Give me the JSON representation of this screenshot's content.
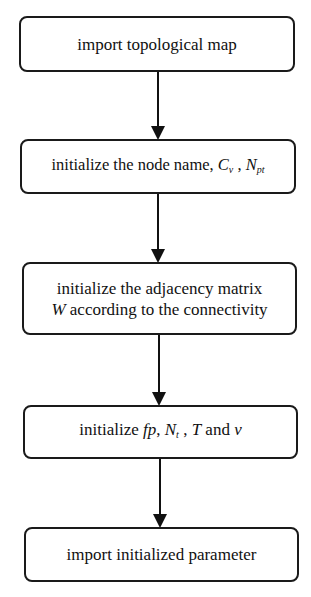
{
  "diagram": {
    "type": "flowchart",
    "direction": "top-to-bottom",
    "steps": [
      {
        "id": 1,
        "text": "import topological map"
      },
      {
        "id": 2,
        "prefix": "initialize the node name, ",
        "var1": "C",
        "var1_sub": "v",
        "sep": " , ",
        "var2": "N",
        "var2_sub": "pt"
      },
      {
        "id": 3,
        "line1": "initialize the adjacency matrix",
        "line2_var": "W",
        "line2_rest": " according to the connectivity"
      },
      {
        "id": 4,
        "prefix": "initialize ",
        "v_fp": "fp",
        "sep1": ", ",
        "v_N": "N",
        "v_N_sub": "t",
        "sep2": " , ",
        "v_T": "T",
        "mid": " and ",
        "v_v": "v"
      },
      {
        "id": 5,
        "text": "import initialized parameter"
      }
    ],
    "edges": [
      [
        1,
        2
      ],
      [
        2,
        3
      ],
      [
        3,
        4
      ],
      [
        4,
        5
      ]
    ]
  }
}
